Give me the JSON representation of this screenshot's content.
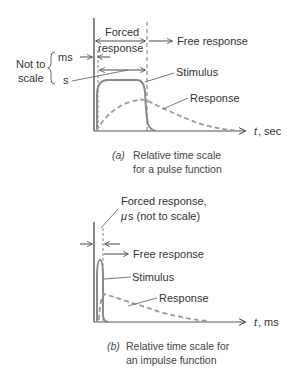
{
  "colors": {
    "ink": "#333333",
    "curve": "#8a8a8a",
    "dashed": "#9a9a9a"
  },
  "panel_a": {
    "forced_response_line1": "Forced",
    "forced_response_line2": "response",
    "free_response": "Free response",
    "not_to_scale_line1": "Not to",
    "not_to_scale_line2": "scale",
    "ms_label": "ms",
    "s_label": "s",
    "stimulus": "Stimulus",
    "response": "Response",
    "axis_t": "t",
    "axis_unit": ", sec",
    "caption_tag": "(a)",
    "caption_line1": "Relative time scale",
    "caption_line2": "for a pulse function"
  },
  "panel_b": {
    "forced_response_line1": "Forced response,",
    "forced_response_mu": "μ",
    "forced_response_line2": "s (not to scale)",
    "free_response": "Free response",
    "stimulus": "Stimulus",
    "response": "Response",
    "axis_t": "t",
    "axis_unit": ", ms",
    "caption_tag": "(b)",
    "caption_line1": "Relative time scale for",
    "caption_line2": "an impulse function"
  }
}
